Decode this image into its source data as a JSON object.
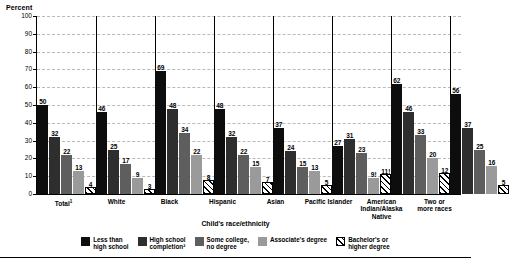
{
  "chart_data": {
    "type": "bar",
    "title": "",
    "ylabel": "Percent",
    "xlabel": "Child's race/ethnicity",
    "ylim": [
      0,
      100
    ],
    "ytick_step": 10,
    "yticks": [
      0,
      10,
      20,
      30,
      40,
      50,
      60,
      70,
      80,
      90,
      100
    ],
    "grid": true,
    "legend_position": "bottom",
    "categories": [
      "Total¹",
      "White",
      "Black",
      "Hispanic",
      "Asian",
      "Pacific Islander",
      "American Indian/Alaska Native",
      "Two or more races"
    ],
    "category_lines": [
      [
        "Total",
        "1"
      ],
      [
        "White"
      ],
      [
        "Black"
      ],
      [
        "Hispanic"
      ],
      [
        "Asian"
      ],
      [
        "Pacific Islander"
      ],
      [
        "American",
        "Indian/Alaska",
        "Native"
      ],
      [
        "Two or",
        "more races"
      ]
    ],
    "series": [
      {
        "name": "Less than high school",
        "values": [
          50,
          46,
          69,
          48,
          37,
          27,
          62,
          56
        ],
        "labels": [
          "50",
          "46",
          "69",
          "48",
          "37",
          "27",
          "62",
          "56"
        ],
        "color": "#0d0d0d"
      },
      {
        "name": "High school completion²",
        "values": [
          32,
          25,
          48,
          32,
          24,
          31,
          46,
          37
        ],
        "labels": [
          "32",
          "25",
          "48",
          "32",
          "24",
          "31",
          "46",
          "37"
        ],
        "color": "#2e2e2e"
      },
      {
        "name": "Some college, no degree",
        "values": [
          22,
          17,
          34,
          22,
          15,
          23,
          33,
          25
        ],
        "labels": [
          "22",
          "17",
          "34",
          "22",
          "15",
          "23",
          "33",
          "25"
        ],
        "color": "#5e5e5e"
      },
      {
        "name": "Associate's degree",
        "values": [
          13,
          9,
          22,
          15,
          13,
          9,
          20,
          16
        ],
        "labels": [
          "13",
          "9",
          "22",
          "15",
          "13",
          "9!",
          "20",
          "16"
        ],
        "color": "#9a9a9a"
      },
      {
        "name": "Bachelor's or higher degree",
        "values": [
          4,
          3,
          8,
          7,
          5,
          11,
          12,
          5
        ],
        "labels": [
          "4",
          "3",
          "8",
          "7",
          "5",
          "11!",
          "12",
          "5"
        ],
        "color": "#ffffff",
        "pattern": "diagonal-hatch"
      }
    ]
  },
  "legend": {
    "items": [
      {
        "label": "Less than\nhigh school",
        "swatch": "s0"
      },
      {
        "label": "High school\ncompletion²",
        "swatch": "s1"
      },
      {
        "label": "Some college,\nno degree",
        "swatch": "s2"
      },
      {
        "label": "Associate's degree",
        "swatch": "s3"
      },
      {
        "label": "Bachelor's or\nhigher degree",
        "swatch": "s4"
      }
    ]
  }
}
